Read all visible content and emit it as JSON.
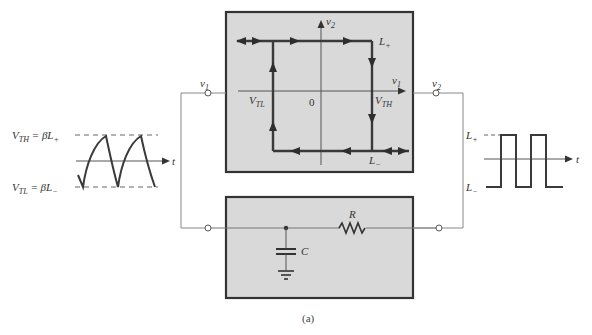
{
  "figure": {
    "caption": "(a)"
  },
  "colors": {
    "box_fill": "#d9d9d9",
    "box_border": "#333333",
    "wire": "#777777",
    "trace": "#444444"
  },
  "transfer_box": {
    "axis_y_label": "v",
    "axis_y_sub": "2",
    "axis_x_label": "v",
    "axis_x_sub": "1",
    "origin_label": "0",
    "vtl_label": "V",
    "vtl_sub": "TL",
    "vth_label": "V",
    "vth_sub": "TH",
    "lplus_label": "L",
    "lplus_sub": "+",
    "lminus_label": "L",
    "lminus_sub": "−"
  },
  "terminals": {
    "input_label": "v",
    "input_sub": "1",
    "output_label": "v",
    "output_sub": "2"
  },
  "rc_network": {
    "resistor_label": "R",
    "capacitor_label": "C"
  },
  "input_waveform": {
    "vth_eq": "V",
    "vth_eq_sub": "TH",
    "vth_rhs": " = βL",
    "vth_rhs_sub": "+",
    "vtl_eq": "V",
    "vtl_eq_sub": "TL",
    "vtl_rhs": " = βL",
    "vtl_rhs_sub": "−",
    "time_label": "t"
  },
  "output_waveform": {
    "lplus_label": "L",
    "lplus_sub": "+",
    "lminus_label": "L",
    "lminus_sub": "−",
    "time_label": "t"
  }
}
